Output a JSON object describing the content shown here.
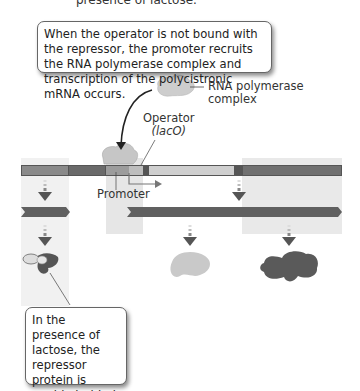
{
  "header": {
    "cropped_text": "presence of lactose."
  },
  "callouts": {
    "top": "When the operator is not bound with the repressor, the promoter recruits the RNA polymerase complex and transcription of the polycistronic mRNA occurs.",
    "bottom": "In the presence of lactose, the repressor protein is unable to bind to the operator."
  },
  "labels": {
    "rna_polymerase_line1": "RNA polymerase",
    "rna_polymerase_line2": "complex",
    "operator_line1": "Operator",
    "operator_line2": "(lacO)",
    "promoter": "Promoter"
  },
  "colors": {
    "dna_dark": "#555555",
    "dna_mid": "#7a7a7a",
    "dna_light": "#c8c8c8",
    "shade_band": "#ececec",
    "protein_light": "#c4c4c4",
    "protein_dark": "#5a5a5a"
  }
}
